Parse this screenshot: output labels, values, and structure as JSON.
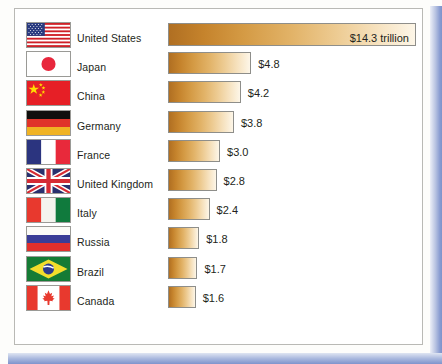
{
  "chart_data": {
    "type": "bar",
    "title": "",
    "xlabel": "",
    "ylabel": "",
    "orientation": "horizontal",
    "units": "trillion US dollars",
    "grid": false,
    "legend": false,
    "xlim": [
      0,
      14.3
    ],
    "categories": [
      "United States",
      "Japan",
      "China",
      "Germany",
      "France",
      "United Kingdom",
      "Italy",
      "Russia",
      "Brazil",
      "Canada"
    ],
    "values": [
      14.3,
      4.8,
      4.2,
      3.8,
      3.0,
      2.8,
      2.4,
      1.8,
      1.7,
      1.6
    ],
    "value_labels": [
      "$14.3 trillion",
      "$4.8",
      "$4.2",
      "$3.8",
      "$3.0",
      "$2.8",
      "$2.4",
      "$1.8",
      "$1.7",
      "$1.6"
    ]
  },
  "rows": [
    {
      "country": "United States",
      "value_label": "$14.3 trillion",
      "value": 14.3,
      "flag": "flag-united-states",
      "label_inside": true
    },
    {
      "country": "Japan",
      "value_label": "$4.8",
      "value": 4.8,
      "flag": "flag-japan",
      "label_inside": false
    },
    {
      "country": "China",
      "value_label": "$4.2",
      "value": 4.2,
      "flag": "flag-china",
      "label_inside": false
    },
    {
      "country": "Germany",
      "value_label": "$3.8",
      "value": 3.8,
      "flag": "flag-germany",
      "label_inside": false
    },
    {
      "country": "France",
      "value_label": "$3.0",
      "value": 3.0,
      "flag": "flag-france",
      "label_inside": false
    },
    {
      "country": "United Kingdom",
      "value_label": "$2.8",
      "value": 2.8,
      "flag": "flag-united-kingdom",
      "label_inside": false
    },
    {
      "country": "Italy",
      "value_label": "$2.4",
      "value": 2.4,
      "flag": "flag-italy",
      "label_inside": false
    },
    {
      "country": "Russia",
      "value_label": "$1.8",
      "value": 1.8,
      "flag": "flag-russia",
      "label_inside": false
    },
    {
      "country": "Brazil",
      "value_label": "$1.7",
      "value": 1.7,
      "flag": "flag-brazil",
      "label_inside": false
    },
    {
      "country": "Canada",
      "value_label": "$1.6",
      "value": 1.6,
      "flag": "flag-canada",
      "label_inside": false
    }
  ],
  "colors": {
    "bar_dark": "#b06f22",
    "bar_light": "#fdf6e8",
    "card_background": "#ffffff",
    "card_border": "#b9b9b5",
    "page_shadow": "#7f93cc",
    "text": "#231f20"
  }
}
